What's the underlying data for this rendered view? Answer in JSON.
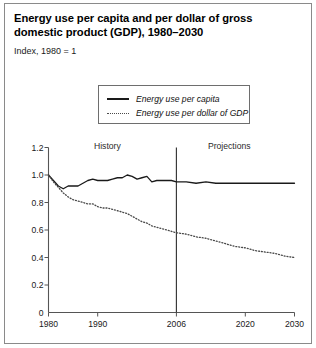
{
  "figure": {
    "title": "Energy use per capita and per dollar of gross domestic product (GDP), 1980–2030",
    "subtitle": "Index, 1980 = 1"
  },
  "legend": {
    "items": [
      {
        "label": "Energy use per capita",
        "style": "solid",
        "color": "#1a1a1a"
      },
      {
        "label": "Energy use per dollar of GDP",
        "style": "dotted",
        "color": "#4a4a4a"
      }
    ]
  },
  "annotations": {
    "history": "History",
    "projections": "Projections",
    "divider_year": 2006
  },
  "axes": {
    "y_ticks": [
      "1.2",
      "1.0",
      "0.8",
      "0.6",
      "0.4",
      "0.2"
    ],
    "y_origin_label": "0",
    "x_ticks": [
      "1980",
      "1990",
      "2006",
      "2020",
      "2030"
    ]
  },
  "chart_data": {
    "type": "line",
    "title": "Energy use per capita and per dollar of gross domestic product (GDP), 1980–2030",
    "subtitle": "Index, 1980 = 1",
    "xlabel": "",
    "ylabel": "Index, 1980 = 1",
    "xlim": [
      1980,
      2030
    ],
    "ylim": [
      0,
      1.2
    ],
    "grid": false,
    "legend_position": "top-center",
    "x_tick_values": [
      1980,
      1990,
      2006,
      2020,
      2030
    ],
    "y_tick_values": [
      0,
      0.2,
      0.4,
      0.6,
      0.8,
      1.0,
      1.2
    ],
    "divider": {
      "x": 2006,
      "left_label": "History",
      "right_label": "Projections"
    },
    "x": [
      1980,
      1981,
      1982,
      1983,
      1984,
      1985,
      1986,
      1987,
      1988,
      1989,
      1990,
      1991,
      1992,
      1993,
      1994,
      1995,
      1996,
      1997,
      1998,
      1999,
      2000,
      2001,
      2002,
      2003,
      2004,
      2005,
      2006,
      2008,
      2010,
      2012,
      2014,
      2016,
      2018,
      2020,
      2022,
      2024,
      2026,
      2028,
      2030
    ],
    "series": [
      {
        "name": "Energy use per capita",
        "style": "solid",
        "color": "#1a1a1a",
        "values": [
          1.0,
          0.96,
          0.92,
          0.9,
          0.92,
          0.92,
          0.92,
          0.94,
          0.96,
          0.97,
          0.96,
          0.96,
          0.96,
          0.97,
          0.98,
          0.98,
          1.0,
          0.99,
          0.97,
          0.98,
          0.99,
          0.95,
          0.96,
          0.96,
          0.96,
          0.96,
          0.95,
          0.95,
          0.94,
          0.95,
          0.94,
          0.94,
          0.94,
          0.94,
          0.94,
          0.94,
          0.94,
          0.94,
          0.94
        ]
      },
      {
        "name": "Energy use per dollar of GDP",
        "style": "dotted",
        "color": "#4a4a4a",
        "values": [
          1.0,
          0.95,
          0.91,
          0.87,
          0.84,
          0.82,
          0.81,
          0.8,
          0.79,
          0.79,
          0.77,
          0.76,
          0.76,
          0.75,
          0.74,
          0.73,
          0.72,
          0.7,
          0.68,
          0.66,
          0.65,
          0.63,
          0.62,
          0.61,
          0.6,
          0.59,
          0.58,
          0.57,
          0.55,
          0.54,
          0.52,
          0.5,
          0.48,
          0.47,
          0.45,
          0.44,
          0.43,
          0.41,
          0.4
        ]
      }
    ]
  }
}
